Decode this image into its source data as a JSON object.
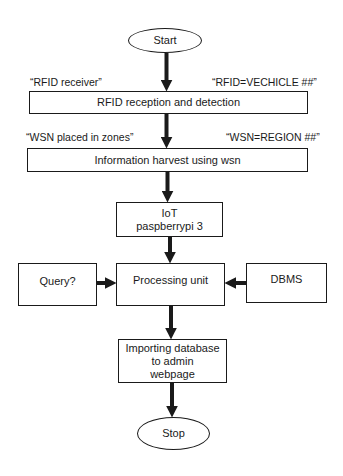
{
  "flowchart": {
    "start": "Start",
    "stop": "Stop",
    "steps": {
      "rfid": "RFID reception and detection",
      "wsn": "Information harvest using wsn",
      "iot_line1": "IoT",
      "iot_line2": "paspberrypi 3",
      "processing": "Processing unit",
      "query": "Query?",
      "dbms": "DBMS",
      "import_line1": "Importing database",
      "import_line2": "to admin",
      "import_line3": "webpage"
    },
    "annotations": {
      "rfid_left": "“RFID receiver”",
      "rfid_right": "“RFID=VECHICLE ##”",
      "wsn_left": "“WSN placed in zones”",
      "wsn_right": "“WSN=REGION ##”"
    },
    "colors": {
      "stroke": "#1a1a1a",
      "background": "#ffffff"
    }
  }
}
